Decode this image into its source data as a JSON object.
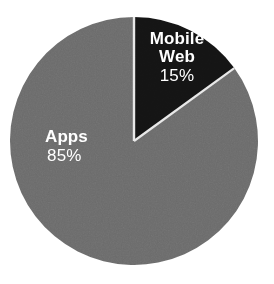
{
  "chart_data": {
    "type": "pie",
    "title": "",
    "subtitle": "",
    "xlabel": "",
    "ylabel": "",
    "legend_position": "none",
    "grid": false,
    "labels_on_slices": true,
    "start_angle_deg": 0,
    "direction": "clockwise",
    "categories": [
      "Mobile Web",
      "Apps"
    ],
    "values": [
      15,
      85
    ],
    "value_suffix": "%",
    "slices": [
      {
        "name": "Mobile Web",
        "name_line_1": "Mobile",
        "name_line_2": "Web",
        "value": 15,
        "value_label": "15%",
        "color": "#141414",
        "label_color": "#ffffff",
        "start_angle_deg": 0,
        "end_angle_deg": 54
      },
      {
        "name": "Apps",
        "name_line_1": "Apps",
        "name_line_2": "",
        "value": 85,
        "value_label": "85%",
        "color": "#6b6b6b",
        "label_color": "#ffffff",
        "start_angle_deg": 54,
        "end_angle_deg": 360
      }
    ]
  },
  "figure": {
    "background_color": "#ffffff",
    "separator_color": "#e8e8e8",
    "center_x": 134,
    "center_y": 141,
    "radius": 124
  }
}
